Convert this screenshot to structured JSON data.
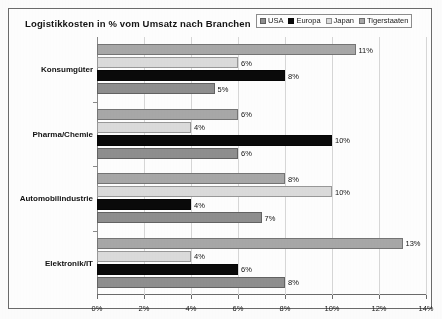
{
  "chart_data": {
    "type": "bar",
    "orientation": "horizontal",
    "title": "Logistikkosten in %  vom Umsatz nach Branchen",
    "xlabel": "",
    "ylabel": "",
    "xlim": [
      0,
      14
    ],
    "xtick_labels": [
      "0%",
      "2%",
      "4%",
      "6%",
      "8%",
      "10%",
      "12%",
      "14%"
    ],
    "xtick_values": [
      0,
      2,
      4,
      6,
      8,
      10,
      12,
      14
    ],
    "grid": true,
    "legend_position": "top-right",
    "categories": [
      "Konsumgüter",
      "Pharma/Chemie",
      "Automobilindustrie",
      "Elektronik/IT"
    ],
    "series": [
      {
        "name": "USA",
        "color": "#8f8f8f",
        "values": [
          5,
          6,
          7,
          8
        ],
        "labels": [
          "5%",
          "6%",
          "7%",
          "8%"
        ]
      },
      {
        "name": "Europa",
        "color": "#0a0a0a",
        "values": [
          8,
          10,
          4,
          6
        ],
        "labels": [
          "8%",
          "10%",
          "4%",
          "6%"
        ]
      },
      {
        "name": "Japan",
        "color": "#dcdcdc",
        "values": [
          6,
          4,
          10,
          4
        ],
        "labels": [
          "6%",
          "4%",
          "10%",
          "4%"
        ]
      },
      {
        "name": "Tigerstaaten",
        "color": "#a8a8a8",
        "values": [
          11,
          6,
          8,
          13
        ],
        "labels": [
          "11%",
          "6%",
          "8%",
          "13%"
        ]
      }
    ]
  },
  "legend": {
    "items": [
      {
        "label": "USA",
        "color": "#8f8f8f"
      },
      {
        "label": "Europa",
        "color": "#0a0a0a"
      },
      {
        "label": "Japan",
        "color": "#dcdcdc"
      },
      {
        "label": "Tigerstaaten",
        "color": "#a8a8a8"
      }
    ]
  }
}
